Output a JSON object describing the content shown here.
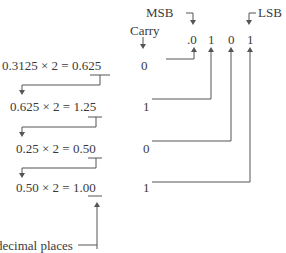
{
  "labels": {
    "msb": "MSB",
    "lsb": "LSB",
    "carry": "Carry",
    "footnote": "decimal places"
  },
  "result_bits": [
    ".0",
    "1",
    "0",
    "1"
  ],
  "steps": [
    {
      "lhs": "0.3125 × 2 = ",
      "int": "0.",
      "frac": "625",
      "carry": "0"
    },
    {
      "lhs": "0.625 × 2 = ",
      "int": "1.",
      "frac": "25",
      "carry": "1"
    },
    {
      "lhs": "0.25 × 2 = ",
      "int": "0.",
      "frac": "50",
      "carry": "0"
    },
    {
      "lhs": "0.50 × 2 = ",
      "int": "1.",
      "frac": "00",
      "carry": "1"
    }
  ]
}
